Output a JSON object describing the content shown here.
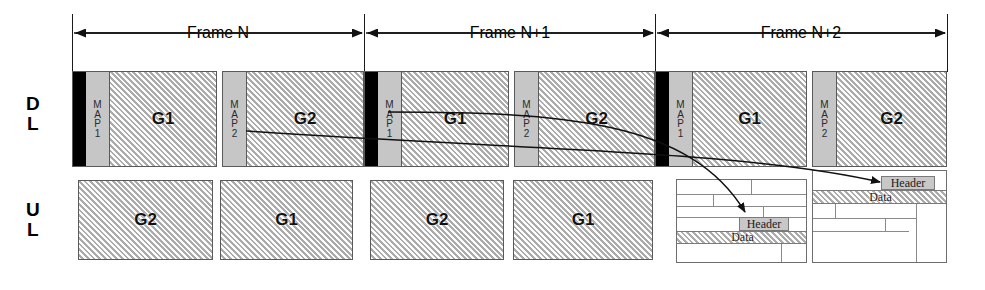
{
  "diagram": {
    "rows": [
      {
        "id": "dl",
        "label_lines": [
          "D",
          "L"
        ],
        "name": "downlink"
      },
      {
        "id": "ul",
        "label_lines": [
          "U",
          "L"
        ],
        "name": "uplink"
      }
    ],
    "frames": [
      {
        "label": "Frame N",
        "start_x": 72,
        "end_x": 364
      },
      {
        "label": "Frame N+1",
        "start_x": 364,
        "end_x": 655
      },
      {
        "label": "Frame N+2",
        "start_x": 655,
        "end_x": 947
      }
    ],
    "dl_blocks": [
      {
        "x": 72,
        "w": 145,
        "preamble": true,
        "map_label_lines": [
          "M",
          "A",
          "P",
          "1"
        ],
        "group": "G1"
      },
      {
        "x": 222,
        "w": 142,
        "preamble": false,
        "map_label_lines": [
          "M",
          "A",
          "P",
          "2"
        ],
        "group": "G2"
      },
      {
        "x": 364,
        "w": 145,
        "preamble": true,
        "map_label_lines": [
          "M",
          "A",
          "P",
          "1"
        ],
        "group": "G1"
      },
      {
        "x": 514,
        "w": 141,
        "preamble": false,
        "map_label_lines": [
          "M",
          "A",
          "P",
          "2"
        ],
        "group": "G2"
      },
      {
        "x": 655,
        "w": 152,
        "preamble": true,
        "map_label_lines": [
          "M",
          "A",
          "P",
          "1"
        ],
        "group": "G1"
      },
      {
        "x": 812,
        "w": 135,
        "preamble": false,
        "map_label_lines": [
          "M",
          "A",
          "P",
          "2"
        ],
        "group": "G2"
      }
    ],
    "ul_blocks": [
      {
        "x": 78,
        "w": 135,
        "group": "G2"
      },
      {
        "x": 220,
        "w": 133,
        "group": "G1"
      },
      {
        "x": 370,
        "w": 134,
        "group": "G2"
      },
      {
        "x": 513,
        "w": 140,
        "group": "G1"
      }
    ],
    "detail_boxes": [
      {
        "id": "left",
        "x": 676,
        "y": 179,
        "w": 131,
        "h": 84,
        "header_label": "Header",
        "data_label": "Data"
      },
      {
        "id": "right",
        "x": 812,
        "y": 170,
        "w": 135,
        "h": 93,
        "header_label": "Header",
        "data_label": "Data"
      }
    ],
    "colors": {
      "preamble": "#000000",
      "map_fill": "#c6c6c6",
      "hatch_fill": "#dedede",
      "outline": "#5a5a5a",
      "header_fill": "#c8c8c8"
    }
  }
}
